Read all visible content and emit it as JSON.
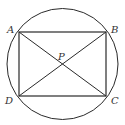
{
  "diagram": {
    "type": "geometry",
    "stroke_color": "#2a2a2a",
    "label_color": "#333333",
    "circle": {
      "cx": 62.5,
      "cy": 64,
      "r": 55.5
    },
    "points": {
      "A": {
        "label": "A",
        "x": 19,
        "y": 32
      },
      "B": {
        "label": "B",
        "x": 106,
        "y": 32
      },
      "C": {
        "label": "C",
        "x": 106,
        "y": 96
      },
      "D": {
        "label": "D",
        "x": 19,
        "y": 96
      },
      "P": {
        "label": "P",
        "x": 62.5,
        "y": 64
      }
    },
    "segments": [
      [
        "A",
        "B"
      ],
      [
        "B",
        "C"
      ],
      [
        "C",
        "D"
      ],
      [
        "D",
        "A"
      ],
      [
        "A",
        "C"
      ],
      [
        "B",
        "D"
      ]
    ]
  }
}
